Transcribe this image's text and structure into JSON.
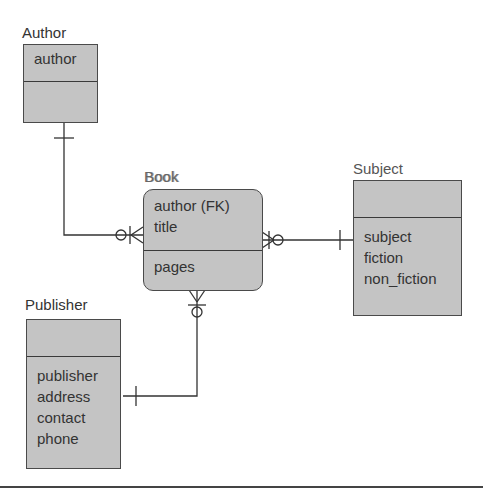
{
  "diagram": {
    "type": "entity-relationship",
    "entities": [
      {
        "name": "Author",
        "key_attributes": [
          "author"
        ],
        "attributes": []
      },
      {
        "name": "Book",
        "key_attributes": [
          "author (FK)",
          "title"
        ],
        "attributes": [
          "pages"
        ]
      },
      {
        "name": "Subject",
        "key_attributes": [],
        "attributes": [
          "subject",
          "fiction",
          "non_fiction"
        ]
      },
      {
        "name": "Publisher",
        "key_attributes": [],
        "attributes": [
          "publisher",
          "address",
          "contact",
          "phone"
        ]
      }
    ],
    "relationships": [
      {
        "from": "Author",
        "to": "Book",
        "from_cardinality": "one",
        "to_cardinality": "zero-or-many"
      },
      {
        "from": "Subject",
        "to": "Book",
        "from_cardinality": "one",
        "to_cardinality": "zero-or-many"
      },
      {
        "from": "Publisher",
        "to": "Book",
        "from_cardinality": "one",
        "to_cardinality": "zero-or-many"
      }
    ],
    "colors": {
      "entity_fill": "#c4c4c4",
      "border": "#4a4a4a",
      "line": "#333333",
      "background": "#ffffff"
    }
  }
}
